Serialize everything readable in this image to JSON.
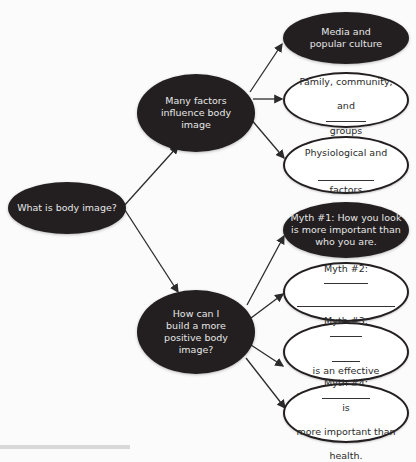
{
  "diagram": {
    "type": "concept-map",
    "root": {
      "label": "What is body image?",
      "style": "dark"
    },
    "branches": [
      {
        "label": "Many factors influence body image",
        "style": "dark",
        "children": [
          {
            "label": "Media and popular culture",
            "style": "dark"
          },
          {
            "label": "Family, community, and ________ groups",
            "style": "light",
            "line1": "Family, community,",
            "line2_pre": "and",
            "line2_post": "groups"
          },
          {
            "label": "Physiological and ____________ factors",
            "style": "light",
            "line1": "Physiological and",
            "line2_post": "factors"
          }
        ]
      },
      {
        "label": "How can I build a more positive body image?",
        "style": "dark",
        "children": [
          {
            "label": "Myth #1: How you look is more important than who you are.",
            "style": "dark"
          },
          {
            "label": "Myth #2: ____________",
            "style": "light",
            "prefix": "Myth #2:"
          },
          {
            "label": "Myth #3: ________ ______ is an effective weight-loss strategy.",
            "style": "light",
            "prefix": "Myth #3:",
            "line2_post": "is an effective",
            "line3": "weight-loss strategy."
          },
          {
            "label": "Myth #4: ___________ is more important than health.",
            "style": "light",
            "prefix": "Myth #4:",
            "line1_post": "is",
            "line2": "more important than",
            "line3": "health."
          }
        ]
      }
    ]
  },
  "colors": {
    "dark_fill": "#231f20",
    "dark_text": "#e6e6e6",
    "outline": "#231f20",
    "background": "#fbfbfb",
    "arrow": "#2b2b2b"
  },
  "text": {
    "root": "What is body image?",
    "b1": "Many factors\ninfluence body\nimage",
    "b2": "How can I\nbuild a more\npositive body\nimage?",
    "media": "Media and\npopular culture",
    "family_1": "Family, community,",
    "family_2a": "and",
    "family_2b": "groups",
    "phys_1": "Physiological and",
    "phys_2b": "factors",
    "myth1": "Myth #1: How you look\nis more important than\nwho you are.",
    "myth2_a": "Myth #2:",
    "myth3_a": "Myth #3:",
    "myth3_b": "is an effective",
    "myth3_c": "weight-loss strategy.",
    "myth4_a": "Myth #4:",
    "myth4_b": "is",
    "myth4_c": "more important than",
    "myth4_d": "health."
  }
}
